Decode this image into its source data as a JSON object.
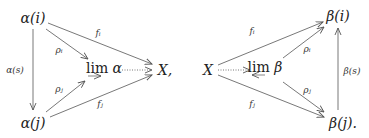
{
  "left_diagram": {
    "nodes": {
      "alpha_i": "α(i)",
      "alpha_j": "α(j)",
      "lim": "lim",
      "lim_sym": "α",
      "target": "X,"
    },
    "labels": {
      "alpha_s": "α(s)",
      "f_i": "fᵢ",
      "rho_i": "ρᵢ",
      "rho_j": "ρⱼ",
      "f_j": "fⱼ"
    }
  },
  "right_diagram": {
    "nodes": {
      "source": "X",
      "lim": "lim",
      "lim_sym": "β",
      "beta_i": "β(i)",
      "beta_j": "β(j)."
    },
    "labels": {
      "beta_s": "β(s)",
      "f_i": "fᵢ",
      "rho_i": "ρᵢ",
      "rho_j": "ρⱼ",
      "f_j": "fⱼ"
    }
  },
  "colors": {
    "arrow": "#555555",
    "text": "#222222"
  }
}
